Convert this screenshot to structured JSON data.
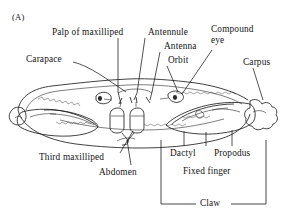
{
  "figure": {
    "panel_letter": "(A)",
    "background_color": "#ffffff",
    "ink_color": "#1a1a1a"
  },
  "labels": {
    "palp_of_maxilliped": "Palp of maxilliped",
    "antennule": "Antennule",
    "antenna": "Antenna",
    "orbit": "Orbit",
    "compound_eye": "Compound\neye",
    "carapace": "Carapace",
    "carpus": "Carpus",
    "third_maxilliped": "Third maxilliped",
    "abdomen": "Abdomen",
    "dactyl": "Dactyl",
    "propodus": "Propodus",
    "fixed_finger": "Fixed finger",
    "claw": "Claw"
  }
}
